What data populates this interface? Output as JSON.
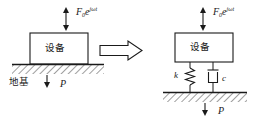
{
  "figure": {
    "type": "engineering-schematic",
    "background_color": "#ffffff",
    "line_color": "#1a1a1a"
  },
  "left_model": {
    "equipment_label": "设备",
    "ground_label": "地基",
    "force_base": "F",
    "force_subscript": "0",
    "force_e": "e",
    "force_exponent": "jωt",
    "static_load_label": "P"
  },
  "transform_arrow": {
    "icon": "right-arrow-icon",
    "direction": "right"
  },
  "right_model": {
    "equipment_label": "设备",
    "force_base": "F",
    "force_subscript": "0",
    "force_e": "e",
    "force_exponent": "jωt",
    "spring_label": "k",
    "damper_label": "c",
    "static_load_label": "P"
  }
}
